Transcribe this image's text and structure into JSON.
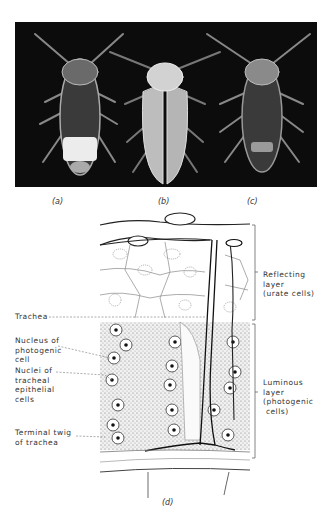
{
  "figure": {
    "panels": [
      {
        "id": "a",
        "caption": "(a)",
        "content": "firefly ventral view, glowing lantern"
      },
      {
        "id": "b",
        "caption": "(b)",
        "content": "firefly dorsal view"
      },
      {
        "id": "c",
        "caption": "(c)",
        "content": "firefly ventral view, dim lantern"
      }
    ],
    "diagram_caption": "(d)",
    "labels_left": {
      "trachea": "Trachea",
      "nucleus_photogenic": "Nucleus of\nphotogenic\ncell",
      "nuclei_tracheal": "Nuclei of\ntracheal\nepithelial\ncells",
      "terminal_twig": "Terminal twig\nof trachea"
    },
    "labels_right": {
      "reflecting_layer": "Reflecting\nlayer\n(urate cells)",
      "luminous_layer": "Luminous\nlayer\n(photogenic\n cells)"
    }
  }
}
